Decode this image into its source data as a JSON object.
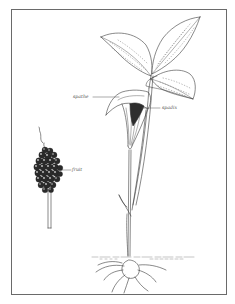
{
  "figure": {
    "labels": {
      "spathe": "spathe",
      "spadix": "spadix",
      "fruit": "fruit"
    },
    "colors": {
      "ink": "#3a3a3a",
      "border": "#6a6a6a",
      "background": "#ffffff",
      "berry": "#2a2a2a"
    }
  }
}
